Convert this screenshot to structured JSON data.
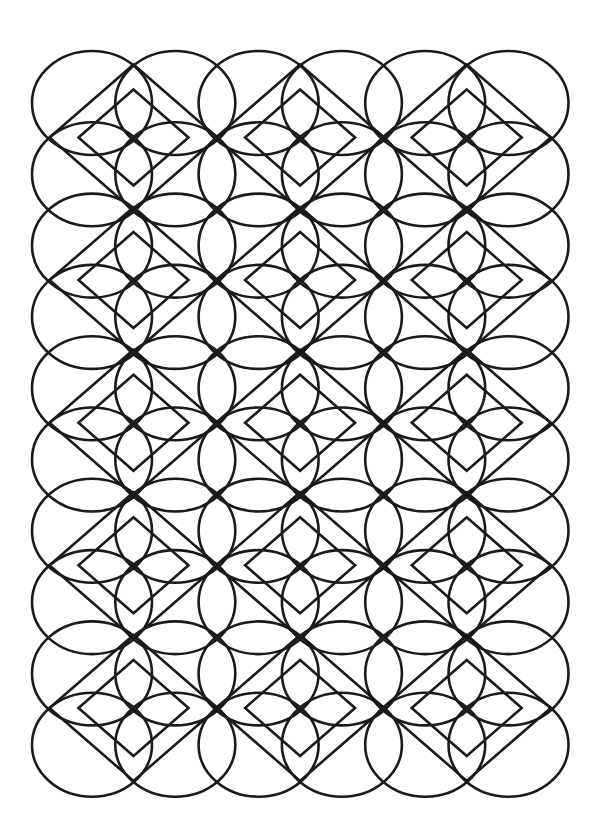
{
  "artwork": {
    "title": "Geometric circle-and-diamond line pattern",
    "background_color": "#ffffff",
    "stroke_color": "#1a1a1a",
    "stroke_width": 2.6,
    "ellipse_grid": {
      "columns": 6,
      "rows": 10,
      "origin_cx": 92,
      "origin_cy": 103,
      "step_x": 83.3,
      "step_y": 71.3,
      "rx": 60,
      "ry": 52
    },
    "diamond_grid": {
      "columns": 3,
      "rows": 5,
      "origin_cx": 133.5,
      "origin_cy": 137.5,
      "step_x": 166.6,
      "step_y": 142.6,
      "outer_half_width": 84,
      "outer_half_height": 73,
      "inner_half_width": 55,
      "inner_half_height": 48
    }
  }
}
